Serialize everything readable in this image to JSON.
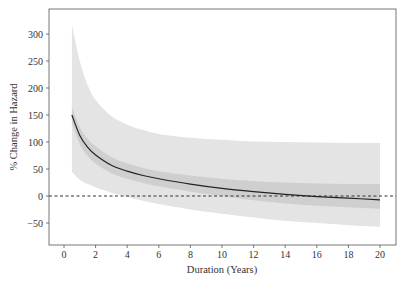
{
  "chart_data": {
    "type": "line",
    "title": "",
    "xlabel": "Duration (Years)",
    "ylabel": "% Change in Hazard",
    "xlim": [
      -1,
      21
    ],
    "ylim": [
      -90,
      340
    ],
    "xticks": [
      0,
      2,
      4,
      6,
      8,
      10,
      12,
      14,
      16,
      18,
      20
    ],
    "yticks": [
      -50,
      0,
      50,
      100,
      150,
      200,
      250,
      300
    ],
    "grid": false,
    "reference_line": {
      "y": 0,
      "style": "dashed"
    },
    "x": [
      0.5,
      1,
      1.5,
      2,
      3,
      4,
      5,
      6,
      8,
      10,
      12,
      14,
      16,
      18,
      20
    ],
    "series": [
      {
        "name": "estimate",
        "values": [
          150,
          112,
          90,
          76,
          57,
          46,
          38,
          32,
          22,
          14,
          8,
          3,
          -1,
          -4,
          -7
        ]
      },
      {
        "name": "inner_band_upper",
        "values": [
          165,
          128,
          106,
          92,
          72,
          60,
          52,
          46,
          38,
          32,
          28,
          25,
          23,
          22,
          22
        ]
      },
      {
        "name": "inner_band_lower",
        "values": [
          135,
          96,
          74,
          60,
          42,
          32,
          24,
          18,
          8,
          0,
          -8,
          -14,
          -18,
          -21,
          -24
        ]
      },
      {
        "name": "outer_band_upper",
        "values": [
          318,
          250,
          205,
          178,
          148,
          132,
          122,
          115,
          108,
          104,
          101,
          100,
          99,
          98,
          98
        ]
      },
      {
        "name": "outer_band_lower",
        "values": [
          45,
          30,
          22,
          16,
          6,
          -2,
          -9,
          -15,
          -25,
          -33,
          -40,
          -46,
          -50,
          -54,
          -57
        ]
      }
    ]
  }
}
